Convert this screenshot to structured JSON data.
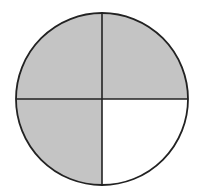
{
  "diagram": {
    "type": "fraction-circle",
    "total_parts": 4,
    "shaded_parts": 3,
    "quadrants": [
      {
        "position": "top-left",
        "shaded": true
      },
      {
        "position": "top-right",
        "shaded": true
      },
      {
        "position": "bottom-left",
        "shaded": true
      },
      {
        "position": "bottom-right",
        "shaded": false
      }
    ],
    "colors": {
      "shaded_fill": "#c4c4c4",
      "unshaded_fill": "#ffffff",
      "stroke": "#222222",
      "background": "#ffffff"
    }
  }
}
